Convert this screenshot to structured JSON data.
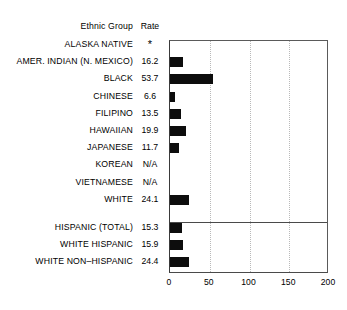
{
  "headers": {
    "group": "Ethnic Group",
    "rate": "Rate"
  },
  "chart_data": {
    "type": "bar",
    "orientation": "horizontal",
    "title": "",
    "xlabel": "",
    "ylabel": "Ethnic Group",
    "xlim": [
      0,
      200
    ],
    "ticks": [
      0,
      50,
      100,
      150,
      200
    ],
    "tick_labels": [
      "0",
      "50",
      "100",
      "150",
      "200"
    ],
    "grid": "vertical-dotted",
    "legend": "none",
    "bar_color": "#0d0d0d",
    "columns": [
      "Ethnic Group",
      "Rate"
    ],
    "categories": [
      "ALASKA NATIVE",
      "AMER. INDIAN (N. MEXICO)",
      "BLACK",
      "CHINESE",
      "FILIPINO",
      "HAWAIIAN",
      "JAPANESE",
      "KOREAN",
      "VIETNAMESE",
      "WHITE",
      "HISPANIC (TOTAL)",
      "WHITE HISPANIC",
      "WHITE NON–HISPANIC"
    ],
    "values": [
      null,
      16.2,
      53.7,
      6.6,
      13.5,
      19.9,
      11.7,
      null,
      null,
      24.1,
      15.3,
      15.9,
      24.4
    ],
    "value_labels": [
      "*",
      "16.2",
      "53.7",
      "6.6",
      "13.5",
      "19.9",
      "11.7",
      "N/A",
      "N/A",
      "24.1",
      "15.3",
      "15.9",
      "24.4"
    ],
    "notes": {
      "asterisk": "*",
      "not_available": "N/A",
      "separator_after_category": "WHITE"
    }
  },
  "rows": [
    {
      "name": "ALASKA NATIVE",
      "rate": "*",
      "value": null,
      "star": true
    },
    {
      "name": "AMER. INDIAN (N. MEXICO)",
      "rate": "16.2",
      "value": 16.2
    },
    {
      "name": "BLACK",
      "rate": "53.7",
      "value": 53.7
    },
    {
      "name": "CHINESE",
      "rate": "6.6",
      "value": 6.6
    },
    {
      "name": "FILIPINO",
      "rate": "13.5",
      "value": 13.5
    },
    {
      "name": "HAWAIIAN",
      "rate": "19.9",
      "value": 19.9
    },
    {
      "name": "JAPANESE",
      "rate": "11.7",
      "value": 11.7
    },
    {
      "name": "KOREAN",
      "rate": "N/A",
      "value": null
    },
    {
      "name": "VIETNAMESE",
      "rate": "N/A",
      "value": null
    },
    {
      "name": "WHITE",
      "rate": "24.1",
      "value": 24.1
    },
    {
      "name": "HISPANIC (TOTAL)",
      "rate": "15.3",
      "value": 15.3
    },
    {
      "name": "WHITE HISPANIC",
      "rate": "15.9",
      "value": 15.9
    },
    {
      "name": "WHITE NON–HISPANIC",
      "rate": "24.4",
      "value": 24.4
    }
  ]
}
